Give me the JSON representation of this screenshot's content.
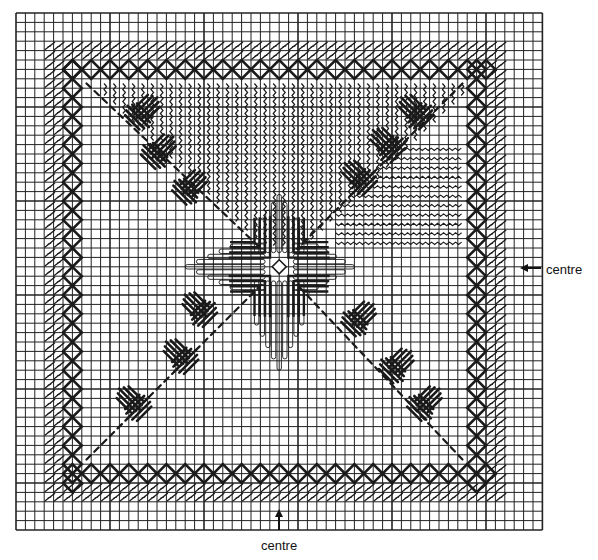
{
  "diagram": {
    "type": "needlepoint-stitch-chart",
    "grid": {
      "origin_x": 16,
      "origin_y": 13,
      "cols": 56,
      "rows": 55,
      "cell": 9.4,
      "line_color": "#222222",
      "major_every": 10
    },
    "ink_color": "#1a1a1a",
    "border_chain": {
      "inset_cells": 5,
      "span_cells": 45
    },
    "outer_slant_band": {
      "inset_cells": 3,
      "span_cells": 49
    },
    "center_cell": [
      28,
      27
    ]
  },
  "labels": {
    "right": {
      "text": "centre",
      "arrow": "left-arrow-icon"
    },
    "bottom": {
      "text": "centre",
      "arrow": "up-arrow-icon"
    }
  }
}
